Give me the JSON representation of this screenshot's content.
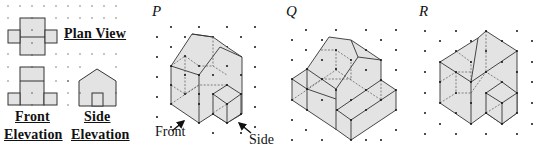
{
  "views": {
    "plan_label": "Plan View",
    "front_label_1": "Front",
    "front_label_2": "Elevation",
    "side_label_1": "Side",
    "side_label_2": "Elevation"
  },
  "options": [
    {
      "letter": "P"
    },
    {
      "letter": "Q"
    },
    {
      "letter": "R"
    }
  ],
  "pointers": {
    "front": "Front",
    "side": "Side"
  },
  "colors": {
    "fill": "#e3e3e3",
    "line": "#333333",
    "dot": "#111111"
  }
}
